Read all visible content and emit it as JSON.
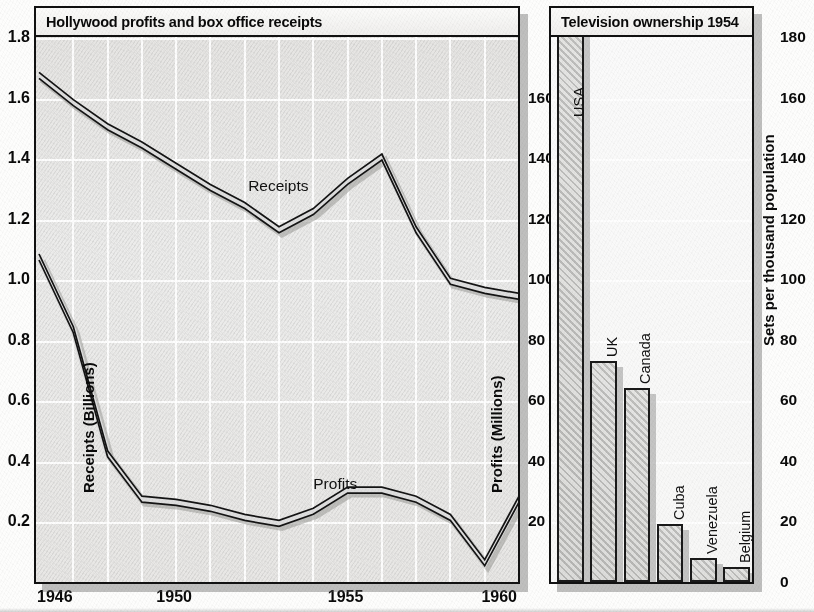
{
  "left_chart": {
    "title": "Hollywood profits and box office receipts",
    "y_left_label": "Receipts (Billions)",
    "y_right_label": "Profits (Millions)",
    "series_labels": {
      "receipts": "Receipts",
      "profits": "Profits"
    },
    "y_left_ticks": [
      "1.8",
      "1.6",
      "1.4",
      "1.2",
      "1.0",
      "0.8",
      "0.6",
      "0.4",
      "0.2"
    ],
    "y_right_ticks": [
      "160",
      "140",
      "120",
      "100",
      "80",
      "60",
      "40",
      "20"
    ],
    "x_ticks": [
      "1946",
      "1950",
      "1955",
      "1960"
    ]
  },
  "right_chart": {
    "title": "Television ownership 1954",
    "y_label": "Sets per thousand population",
    "y_ticks": [
      "180",
      "160",
      "140",
      "120",
      "100",
      "80",
      "60",
      "40",
      "20",
      "0"
    ],
    "bar_labels": [
      "USA",
      "UK",
      "Canada",
      "Cuba",
      "Venezuela",
      "Belgium"
    ]
  },
  "chart_data": [
    {
      "type": "line",
      "title": "Hollywood profits and box office receipts",
      "xlabel": "",
      "ylabel": "Receipts (Billions)",
      "y2label": "Profits (Millions)",
      "x": [
        1946,
        1947,
        1948,
        1949,
        1950,
        1951,
        1952,
        1953,
        1954,
        1955,
        1956,
        1957,
        1958,
        1959,
        1960
      ],
      "xlim": [
        1946,
        1960
      ],
      "ylim": [
        0.0,
        1.8
      ],
      "y2lim": [
        0,
        160
      ],
      "grid": true,
      "legend": "inline-annotations",
      "series": [
        {
          "name": "Receipts",
          "axis": "left",
          "units": "billions of dollars",
          "values": [
            1.68,
            1.59,
            1.51,
            1.45,
            1.38,
            1.31,
            1.25,
            1.17,
            1.23,
            1.33,
            1.41,
            1.17,
            1.0,
            0.97,
            0.95
          ]
        },
        {
          "name": "Profits",
          "axis": "right",
          "units": "millions of dollars",
          "values": [
            108,
            84,
            43,
            28,
            27,
            25,
            22,
            20,
            24,
            31,
            31,
            28,
            22,
            7,
            28
          ]
        }
      ]
    },
    {
      "type": "bar",
      "title": "Television ownership 1954",
      "xlabel": "",
      "ylabel": "Sets per thousand population",
      "ylim": [
        0,
        180
      ],
      "grid": true,
      "categories": [
        "USA",
        "UK",
        "Canada",
        "Cuba",
        "Venezuela",
        "Belgium"
      ],
      "values": [
        205,
        73,
        64,
        19,
        8,
        5
      ],
      "notes": "USA bar exceeds the plotted 180 axis maximum and runs off the top of the frame"
    }
  ]
}
